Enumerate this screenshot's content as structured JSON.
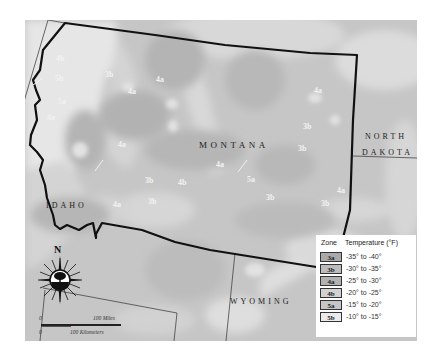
{
  "map": {
    "title": "Montana Plant Hardiness Zones",
    "states": {
      "montana": "MONTANA",
      "north_dakota_line1": "NORTH",
      "north_dakota_line2": "DAKOTA",
      "idaho": "IDAHO",
      "wyoming": "WYOMING"
    },
    "zone_labels": [
      {
        "text": "4b",
        "x": 30,
        "y": 33
      },
      {
        "text": "5b",
        "x": 34,
        "y": 50
      },
      {
        "text": "5a",
        "x": 38,
        "y": 70
      },
      {
        "text": "4a",
        "x": 87,
        "y": 62
      },
      {
        "text": "3b",
        "x": 142,
        "y": 47
      },
      {
        "text": "4a",
        "x": 95,
        "y": 119
      },
      {
        "text": "4a",
        "x": 30,
        "y": 145
      },
      {
        "text": "3b",
        "x": 64,
        "y": 178
      },
      {
        "text": "4a",
        "x": 40,
        "y": 198
      },
      {
        "text": "3b",
        "x": 88,
        "y": 183
      },
      {
        "text": "4b",
        "x": 140,
        "y": 151
      },
      {
        "text": "4a",
        "x": 173,
        "y": 106
      },
      {
        "text": "5a",
        "x": 217,
        "y": 127
      },
      {
        "text": "3b",
        "x": 242,
        "y": 146
      },
      {
        "text": "4a",
        "x": 286,
        "y": 38
      },
      {
        "text": "3b",
        "x": 278,
        "y": 76
      },
      {
        "text": "3b",
        "x": 258,
        "y": 106
      },
      {
        "text": "4a",
        "x": 314,
        "y": 138
      },
      {
        "text": "3b",
        "x": 321,
        "y": 161
      },
      {
        "text": "4a",
        "x": 14,
        "y": 190
      }
    ]
  },
  "compass": {
    "north_label": "N",
    "icon": "compass-rose-icon"
  },
  "scale_bar": {
    "miles_zero": "0",
    "miles_label": "100 Miles",
    "km_zero": "0",
    "km_label": "100 Kilometers"
  },
  "legend": {
    "zone_header": "Zone",
    "temp_header": "Temperature (°F)",
    "rows": [
      {
        "zone": "3a",
        "range": "-35° to -40°",
        "color": "#a9a9a9"
      },
      {
        "zone": "3b",
        "range": "-30° to -35°",
        "color": "#bcbcbc"
      },
      {
        "zone": "4a",
        "range": "-25° to -30°",
        "color": "#b2b2b2"
      },
      {
        "zone": "4b",
        "range": "-20° to -25°",
        "color": "#d2d2d2"
      },
      {
        "zone": "5a",
        "range": "-15° to -20°",
        "color": "#c6c6c6"
      },
      {
        "zone": "5b",
        "range": "-10° to -15°",
        "color": "#ebebeb"
      }
    ]
  },
  "colors": {
    "border": "#111111",
    "thin_border": "#444444",
    "background": "#c9c9c9"
  }
}
